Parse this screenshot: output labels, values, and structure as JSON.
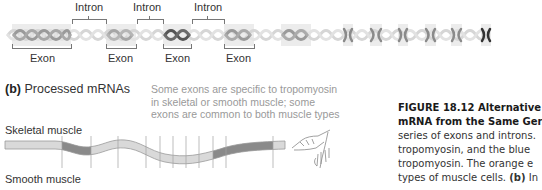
{
  "dna_panel": {
    "intron_labels": [
      "Intron",
      "Intron",
      "Intron"
    ],
    "exon_labels": [
      "Exon",
      "Exon",
      "Exon",
      "Exon"
    ],
    "colors": {
      "exon_box": "#ececec",
      "helix_light": "#d6d6d6",
      "helix_mid": "#9a9a9a",
      "helix_dark": "#555555"
    }
  },
  "mrna_panel": {
    "part_label": "(b)",
    "title": "Processed mRNAs",
    "note_lines": [
      "Some exons are specific to tropomyosin",
      "in skeletal or smooth muscle; some",
      "exons are common to both muscle types"
    ],
    "rows": [
      {
        "label": "Skeletal muscle"
      },
      {
        "label": "Smooth muscle"
      }
    ],
    "colors": {
      "common_exon": "#d9d9d9",
      "specific_exon": "#8a8a8a",
      "border": "#9a9a9a"
    }
  },
  "caption": {
    "heading_line1": "FIGURE 18.12  Alternative",
    "heading_line2": "mRNA from the Same Ger",
    "body_lines": [
      "series of exons and introns.",
      "tropomyosin, and the blue",
      "tropomyosin. The orange e",
      "types of muscle cells."
    ],
    "tail_bold": "(b)",
    "tail_text": " In"
  }
}
